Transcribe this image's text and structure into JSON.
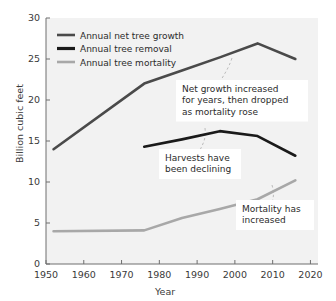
{
  "chart_data": {
    "type": "line",
    "title": "",
    "xlabel": "Year",
    "ylabel": "Billion cubic feet",
    "xlim": [
      1950,
      2022
    ],
    "ylim": [
      0,
      30
    ],
    "xticks": [
      1950,
      1960,
      1970,
      1980,
      1990,
      2000,
      2010,
      2020
    ],
    "yticks": [
      0,
      5,
      10,
      15,
      20,
      25,
      30
    ],
    "grid": false,
    "legend_position": "top-left",
    "series": [
      {
        "name": "Annual net tree growth",
        "color": "#4a4a4a",
        "x": [
          1952,
          1976,
          1986,
          1996,
          2006,
          2016
        ],
        "values": [
          14.0,
          22.0,
          23.6,
          25.2,
          26.9,
          25.0
        ]
      },
      {
        "name": "Annual tree removal",
        "color": "#1a1a1a",
        "x": [
          1976,
          1986,
          1996,
          2006,
          2016
        ],
        "values": [
          14.3,
          15.2,
          16.2,
          15.6,
          13.2
        ]
      },
      {
        "name": "Annual tree mortality",
        "color": "#a8a8a8",
        "x": [
          1952,
          1976,
          1986,
          1996,
          2006,
          2016
        ],
        "values": [
          4.0,
          4.1,
          5.6,
          6.7,
          7.9,
          10.2
        ]
      }
    ],
    "annotations": [
      {
        "id": "net-growth-callout",
        "text": "Net growth increased for years, then dropped as mortality rose",
        "lines": [
          "Net growth increased",
          "for years, then dropped",
          "as mortality rose"
        ]
      },
      {
        "id": "harvest-callout",
        "text": "Harvests have been declining",
        "lines": [
          "Harvests have",
          "been declining"
        ]
      },
      {
        "id": "mortality-callout",
        "text": "Mortality has increased",
        "lines": [
          "Mortality has",
          "increased"
        ]
      }
    ]
  },
  "xtick_labels": [
    "1950",
    "1960",
    "1970",
    "1980",
    "1990",
    "2000",
    "2010",
    "2020"
  ],
  "ytick_labels": [
    "0",
    "5",
    "10",
    "15",
    "20",
    "25",
    "30"
  ],
  "legend": {
    "items": [
      {
        "label": "Annual net tree growth"
      },
      {
        "label": "Annual tree removal"
      },
      {
        "label": "Annual tree mortality"
      }
    ]
  },
  "colors": {
    "net_growth": "#4a4a4a",
    "removal": "#1a1a1a",
    "mortality": "#a8a8a8",
    "plot_background": "#f2f2f2",
    "axis": "#6e6e6e",
    "text": "#3a3a3a"
  }
}
